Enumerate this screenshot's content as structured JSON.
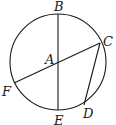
{
  "diagram": {
    "type": "circle-geometry",
    "circle": {
      "center": "A",
      "cx": 58,
      "cy": 62,
      "r": 48
    },
    "points": [
      {
        "name": "A",
        "label": "A",
        "x": 58,
        "y": 62,
        "lx": 45,
        "ly": 64
      },
      {
        "name": "B",
        "label": "B",
        "x": 58,
        "y": 14,
        "lx": 54,
        "ly": 11
      },
      {
        "name": "C",
        "label": "C",
        "x": 100,
        "y": 43,
        "lx": 103,
        "ly": 46
      },
      {
        "name": "D",
        "label": "D",
        "x": 84,
        "y": 105,
        "lx": 83,
        "ly": 118
      },
      {
        "name": "E",
        "label": "E",
        "x": 58,
        "y": 110,
        "lx": 54,
        "ly": 125
      },
      {
        "name": "F",
        "label": "F",
        "x": 14,
        "y": 83,
        "lx": 2,
        "ly": 96
      }
    ],
    "segments": [
      {
        "from": "B",
        "to": "E"
      },
      {
        "from": "C",
        "to": "F"
      },
      {
        "from": "C",
        "to": "D"
      }
    ]
  }
}
